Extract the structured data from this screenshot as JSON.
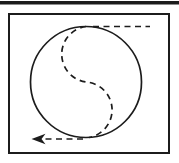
{
  "colors": {
    "ink": "#1c1c1c",
    "background": "#ffffff"
  },
  "diagram": {
    "top_rule": {
      "x": "0",
      "y": "1",
      "width": "179",
      "height": "3.5"
    },
    "frame": {
      "x": "9",
      "y": "14",
      "width": "160",
      "height": "139",
      "stroke_width": "2"
    },
    "circle": {
      "cx": "86",
      "cy": "82",
      "r": "55.5",
      "stroke_width": "1.7"
    },
    "s_curve": {
      "path": "M 86 26.5 A 28 28 0 0 0 86 82 A 28 28 0 0 1 89 137.5",
      "stroke_width": "1.7"
    },
    "top_dashed_line": {
      "path": "M 93 26.5 L 150 26.5",
      "stroke_width": "1.7"
    },
    "bottom_dashed_line": {
      "path": "M 83 139 L 43 139",
      "stroke_width": "1.7"
    },
    "arrowhead": {
      "path": "M 31.5 139 L 45.5 133.8 L 41.5 139 L 45.5 144.2 Z"
    }
  }
}
